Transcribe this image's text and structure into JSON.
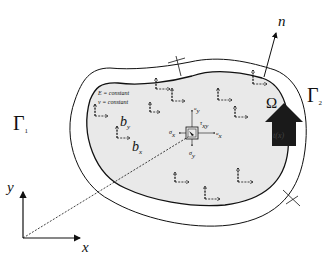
{
  "diagram": {
    "type": "elastic-body-domain",
    "domain_label": "Ω",
    "boundary_labels": {
      "gamma1": "Γ",
      "gamma1_sub": "1",
      "gamma2": "Γ",
      "gamma2_sub": "2"
    },
    "normal_label": "n",
    "material": {
      "E_line": "E = constant",
      "nu_line": "ν = constant"
    },
    "body_force": {
      "bx": "b",
      "bx_sub": "x",
      "by": "b",
      "by_sub": "y"
    },
    "stress_element": {
      "sigma_x": "σ",
      "sigma_x_sub": "x",
      "sigma_y": "σ",
      "sigma_y_sub": "y",
      "tau": "τ",
      "tau_sub": "xy",
      "u_x": "u",
      "u_x_sub": "x",
      "u_y": "u",
      "u_y_sub": "y"
    },
    "traction_label": "t(x)",
    "axes": {
      "x": "x",
      "y": "y"
    },
    "colors": {
      "domain_fill": "#e9e9e9",
      "stroke": "#111111",
      "arrow_fill": "#1a1a1a",
      "background": "#ffffff"
    }
  }
}
